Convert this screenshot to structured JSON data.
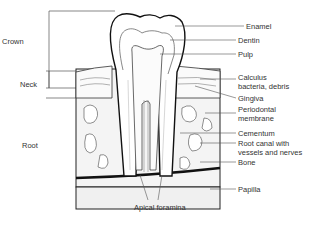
{
  "diagram": {
    "regions": [
      {
        "id": "crown",
        "label": "Crown"
      },
      {
        "id": "neck",
        "label": "Neck"
      },
      {
        "id": "root",
        "label": "Root"
      }
    ],
    "labels": [
      {
        "id": "enamel",
        "text": "Enamel"
      },
      {
        "id": "dentin",
        "text": "Dentin"
      },
      {
        "id": "pulp",
        "text": "Pulp"
      },
      {
        "id": "calculus",
        "line1": "Calculus",
        "line2": "bacteria, debris"
      },
      {
        "id": "gingiva",
        "text": "Gingiva"
      },
      {
        "id": "periodontal",
        "line1": "Periodontal",
        "line2": "membrane"
      },
      {
        "id": "cementum",
        "text": "Cementum"
      },
      {
        "id": "root-canal",
        "line1": "Root canal with",
        "line2": "vessels and nerves"
      },
      {
        "id": "bone",
        "text": "Bone"
      },
      {
        "id": "papilla",
        "text": "Papilla"
      }
    ],
    "bottom_label": "Apical foramina"
  }
}
